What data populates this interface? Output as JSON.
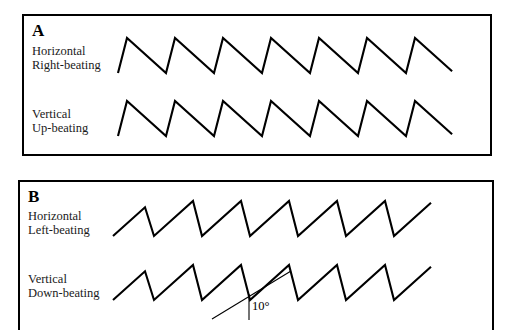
{
  "figure": {
    "panels": [
      {
        "id": "A",
        "letter": "A",
        "traces": [
          {
            "id": "horizontal-right-beating",
            "label": "Horizontal\nRight-beating",
            "direction": "right-beating",
            "plane": "horizontal",
            "fast_phase": "upward",
            "cycles": 7
          },
          {
            "id": "vertical-up-beating",
            "label": "Vertical\nUp-beating",
            "direction": "up-beating",
            "plane": "vertical",
            "fast_phase": "upward",
            "cycles": 7
          }
        ]
      },
      {
        "id": "B",
        "letter": "B",
        "traces": [
          {
            "id": "horizontal-left-beating",
            "label": "Horizontal\nLeft-beating",
            "direction": "left-beating",
            "plane": "horizontal",
            "fast_phase": "downward",
            "cycles": 7
          },
          {
            "id": "vertical-down-beating",
            "label": "Vertical\nDown-beating",
            "direction": "down-beating",
            "plane": "vertical",
            "fast_phase": "downward",
            "cycles": 7
          }
        ]
      }
    ],
    "annotation": {
      "angle_label": "10°",
      "description": "slow-phase angle reference"
    },
    "colors": {
      "stroke": "#000000",
      "background": "#ffffff",
      "text": "#1a1a1a"
    }
  }
}
